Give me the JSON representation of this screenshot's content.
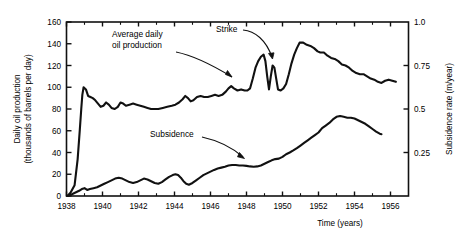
{
  "chart_data": {
    "type": "line",
    "title": "",
    "xlabel": "Time (years)",
    "ylabel": "Daily oil production (thousands of barrels per day)",
    "y2label": "Subsidence rate (m/year)",
    "xlim": [
      1938,
      1957
    ],
    "ylim": [
      0,
      160
    ],
    "y2lim": [
      0,
      1.0
    ],
    "xticks": [
      1938,
      1940,
      1942,
      1944,
      1946,
      1948,
      1950,
      1952,
      1954,
      1956
    ],
    "xtick_labels": [
      "1938",
      "1940",
      "1942",
      "1944",
      "1946",
      "1948",
      "1950",
      "1952",
      "1954",
      "1956"
    ],
    "yticks": [
      0,
      20,
      40,
      60,
      80,
      100,
      120,
      140,
      160
    ],
    "ytick_labels": [
      "0",
      "20",
      "40",
      "60",
      "80",
      "100",
      "120",
      "140",
      "160"
    ],
    "y2ticks": [
      0.25,
      0.5,
      0.75,
      1.0
    ],
    "y2tick_labels": [
      "0.25",
      "0.5",
      "0.75",
      "1.0"
    ],
    "grid": false,
    "legend": "none",
    "annotations": [
      {
        "name": "average-daily-oil-production",
        "text": "Average daily\noil production",
        "line1": "Average daily",
        "line2": "oil production",
        "x_px": 112,
        "y_px": 37
      },
      {
        "name": "strike",
        "text": "Strike",
        "x_px": 216,
        "y_px": 32
      },
      {
        "name": "subsidence",
        "text": "Subsidence",
        "x_px": 150,
        "y_px": 137
      }
    ],
    "series": [
      {
        "name": "Average daily oil production",
        "axis": "left",
        "units": "thousands of barrels per day",
        "points": [
          [
            1938.05,
            0
          ],
          [
            1938.22,
            3
          ],
          [
            1938.45,
            10
          ],
          [
            1938.62,
            34
          ],
          [
            1938.74,
            61
          ],
          [
            1938.82,
            80
          ],
          [
            1938.88,
            93
          ],
          [
            1938.95,
            100
          ],
          [
            1939.08,
            98
          ],
          [
            1939.2,
            92
          ],
          [
            1939.33,
            91
          ],
          [
            1939.46,
            90
          ],
          [
            1939.6,
            88
          ],
          [
            1939.75,
            85
          ],
          [
            1939.9,
            82
          ],
          [
            1940.05,
            83
          ],
          [
            1940.2,
            86
          ],
          [
            1940.35,
            84
          ],
          [
            1940.5,
            81
          ],
          [
            1940.68,
            80
          ],
          [
            1940.85,
            82
          ],
          [
            1941.0,
            86
          ],
          [
            1941.15,
            85
          ],
          [
            1941.3,
            83
          ],
          [
            1941.5,
            84
          ],
          [
            1941.7,
            85
          ],
          [
            1941.9,
            84
          ],
          [
            1942.1,
            83
          ],
          [
            1942.3,
            82
          ],
          [
            1942.5,
            81
          ],
          [
            1942.7,
            80
          ],
          [
            1942.9,
            80
          ],
          [
            1943.1,
            80
          ],
          [
            1943.35,
            81
          ],
          [
            1943.6,
            82
          ],
          [
            1943.85,
            83
          ],
          [
            1944.05,
            84
          ],
          [
            1944.25,
            86
          ],
          [
            1944.45,
            89
          ],
          [
            1944.6,
            92
          ],
          [
            1944.75,
            90
          ],
          [
            1944.9,
            87
          ],
          [
            1945.05,
            88
          ],
          [
            1945.25,
            91
          ],
          [
            1945.45,
            92
          ],
          [
            1945.65,
            91
          ],
          [
            1945.85,
            91
          ],
          [
            1946.05,
            92
          ],
          [
            1946.25,
            93
          ],
          [
            1946.45,
            92
          ],
          [
            1946.65,
            93
          ],
          [
            1946.85,
            96
          ],
          [
            1947.0,
            99
          ],
          [
            1947.15,
            101
          ],
          [
            1947.3,
            99
          ],
          [
            1947.5,
            97
          ],
          [
            1947.7,
            98
          ],
          [
            1947.9,
            97
          ],
          [
            1948.05,
            97
          ],
          [
            1948.2,
            99
          ],
          [
            1948.35,
            108
          ],
          [
            1948.5,
            118
          ],
          [
            1948.65,
            124
          ],
          [
            1948.8,
            128
          ],
          [
            1948.95,
            130
          ],
          [
            1949.05,
            124
          ],
          [
            1949.15,
            110
          ],
          [
            1949.25,
            98
          ],
          [
            1949.35,
            110
          ],
          [
            1949.45,
            120
          ],
          [
            1949.55,
            118
          ],
          [
            1949.65,
            108
          ],
          [
            1949.75,
            98
          ],
          [
            1949.9,
            97
          ],
          [
            1950.05,
            99
          ],
          [
            1950.2,
            103
          ],
          [
            1950.35,
            112
          ],
          [
            1950.5,
            122
          ],
          [
            1950.65,
            130
          ],
          [
            1950.8,
            136
          ],
          [
            1950.95,
            141
          ],
          [
            1951.15,
            141
          ],
          [
            1951.35,
            139
          ],
          [
            1951.55,
            138
          ],
          [
            1951.75,
            136
          ],
          [
            1951.95,
            133
          ],
          [
            1952.1,
            132
          ],
          [
            1952.3,
            132
          ],
          [
            1952.5,
            129
          ],
          [
            1952.7,
            127
          ],
          [
            1952.9,
            126
          ],
          [
            1953.1,
            124
          ],
          [
            1953.3,
            121
          ],
          [
            1953.5,
            120
          ],
          [
            1953.7,
            118
          ],
          [
            1953.9,
            115
          ],
          [
            1954.1,
            113
          ],
          [
            1954.3,
            112
          ],
          [
            1954.5,
            112
          ],
          [
            1954.7,
            110
          ],
          [
            1954.9,
            108
          ],
          [
            1955.1,
            107
          ],
          [
            1955.3,
            105
          ],
          [
            1955.5,
            104
          ],
          [
            1955.7,
            106
          ],
          [
            1955.9,
            107
          ],
          [
            1956.1,
            106
          ],
          [
            1956.3,
            105
          ]
        ]
      },
      {
        "name": "Subsidence",
        "axis": "right",
        "units": "m/year",
        "points": [
          [
            1938.05,
            0.0
          ],
          [
            1938.3,
            0.01
          ],
          [
            1938.5,
            0.02
          ],
          [
            1938.7,
            0.03
          ],
          [
            1938.85,
            0.04
          ],
          [
            1939.0,
            0.045
          ],
          [
            1939.15,
            0.035
          ],
          [
            1939.3,
            0.04
          ],
          [
            1939.5,
            0.045
          ],
          [
            1939.7,
            0.05
          ],
          [
            1939.9,
            0.06
          ],
          [
            1940.1,
            0.07
          ],
          [
            1940.3,
            0.08
          ],
          [
            1940.5,
            0.09
          ],
          [
            1940.7,
            0.1
          ],
          [
            1940.9,
            0.105
          ],
          [
            1941.1,
            0.1
          ],
          [
            1941.3,
            0.09
          ],
          [
            1941.5,
            0.08
          ],
          [
            1941.7,
            0.075
          ],
          [
            1941.9,
            0.08
          ],
          [
            1942.1,
            0.09
          ],
          [
            1942.3,
            0.1
          ],
          [
            1942.5,
            0.095
          ],
          [
            1942.7,
            0.085
          ],
          [
            1942.9,
            0.075
          ],
          [
            1943.1,
            0.07
          ],
          [
            1943.3,
            0.08
          ],
          [
            1943.5,
            0.095
          ],
          [
            1943.7,
            0.11
          ],
          [
            1943.9,
            0.12
          ],
          [
            1944.05,
            0.125
          ],
          [
            1944.2,
            0.12
          ],
          [
            1944.35,
            0.105
          ],
          [
            1944.5,
            0.085
          ],
          [
            1944.65,
            0.07
          ],
          [
            1944.8,
            0.065
          ],
          [
            1945.0,
            0.075
          ],
          [
            1945.2,
            0.09
          ],
          [
            1945.4,
            0.105
          ],
          [
            1945.6,
            0.12
          ],
          [
            1945.8,
            0.13
          ],
          [
            1946.0,
            0.14
          ],
          [
            1946.2,
            0.15
          ],
          [
            1946.4,
            0.158
          ],
          [
            1946.6,
            0.163
          ],
          [
            1946.8,
            0.168
          ],
          [
            1947.0,
            0.175
          ],
          [
            1947.2,
            0.178
          ],
          [
            1947.4,
            0.178
          ],
          [
            1947.6,
            0.175
          ],
          [
            1947.8,
            0.175
          ],
          [
            1948.0,
            0.173
          ],
          [
            1948.2,
            0.17
          ],
          [
            1948.4,
            0.168
          ],
          [
            1948.6,
            0.17
          ],
          [
            1948.8,
            0.175
          ],
          [
            1949.0,
            0.185
          ],
          [
            1949.2,
            0.195
          ],
          [
            1949.4,
            0.205
          ],
          [
            1949.6,
            0.212
          ],
          [
            1949.8,
            0.215
          ],
          [
            1950.0,
            0.225
          ],
          [
            1950.2,
            0.24
          ],
          [
            1950.4,
            0.25
          ],
          [
            1950.6,
            0.262
          ],
          [
            1950.8,
            0.275
          ],
          [
            1951.0,
            0.29
          ],
          [
            1951.2,
            0.305
          ],
          [
            1951.4,
            0.32
          ],
          [
            1951.6,
            0.335
          ],
          [
            1951.8,
            0.35
          ],
          [
            1952.0,
            0.365
          ],
          [
            1952.2,
            0.39
          ],
          [
            1952.4,
            0.405
          ],
          [
            1952.6,
            0.42
          ],
          [
            1952.8,
            0.44
          ],
          [
            1953.0,
            0.455
          ],
          [
            1953.2,
            0.46
          ],
          [
            1953.4,
            0.455
          ],
          [
            1953.6,
            0.45
          ],
          [
            1953.8,
            0.45
          ],
          [
            1954.0,
            0.445
          ],
          [
            1954.2,
            0.435
          ],
          [
            1954.4,
            0.425
          ],
          [
            1954.6,
            0.415
          ],
          [
            1954.8,
            0.4
          ],
          [
            1955.0,
            0.385
          ],
          [
            1955.2,
            0.37
          ],
          [
            1955.4,
            0.358
          ],
          [
            1955.5,
            0.355
          ]
        ]
      }
    ]
  }
}
